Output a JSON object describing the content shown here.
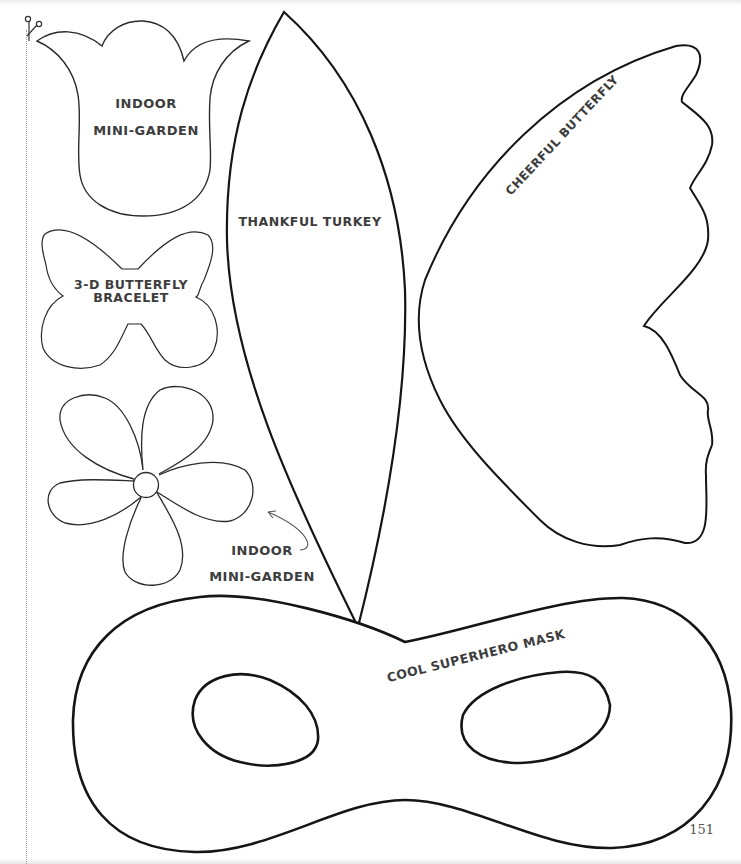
{
  "page": {
    "page_number": "151",
    "scissors_icon": "scissors-icon"
  },
  "templates": {
    "tulip": {
      "line1": "INDOOR",
      "line2": "MINI-GARDEN"
    },
    "butterfly_bracelet": {
      "line1": "3-D BUTTERFLY",
      "line2": "BRACELET"
    },
    "flower": {
      "line1": "INDOOR",
      "line2": "MINI-GARDEN"
    },
    "turkey_feather": {
      "label": "THANKFUL TURKEY"
    },
    "butterfly_wing": {
      "label": "CHEERFUL BUTTERFLY"
    },
    "mask": {
      "label": "COOL SUPERHERO MASK"
    }
  },
  "colors": {
    "outline": "#1a1a1a",
    "text": "#3d3d3d"
  }
}
